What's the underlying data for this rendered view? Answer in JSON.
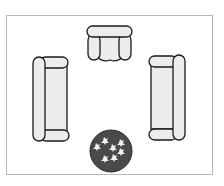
{
  "diagram": {
    "type": "floor-plan",
    "title": "",
    "room": {
      "border_color": "#b8b8b8",
      "fill": "#ffffff"
    },
    "furniture": [
      {
        "id": "armchair",
        "label": "Armchair",
        "position": "top-center"
      },
      {
        "id": "sofa-left",
        "label": "Sofa",
        "position": "left",
        "orientation": "vertical"
      },
      {
        "id": "sofa-right",
        "label": "Sofa",
        "position": "right",
        "orientation": "vertical"
      },
      {
        "id": "round-rug",
        "label": "Round patterned rug / ottoman",
        "position": "bottom-center"
      }
    ],
    "colors": {
      "furniture_fill": "#ececec",
      "outline": "#1a1a1a",
      "rug_fill": "#4a4a4a",
      "rug_pattern": "#f2f2f2"
    }
  }
}
